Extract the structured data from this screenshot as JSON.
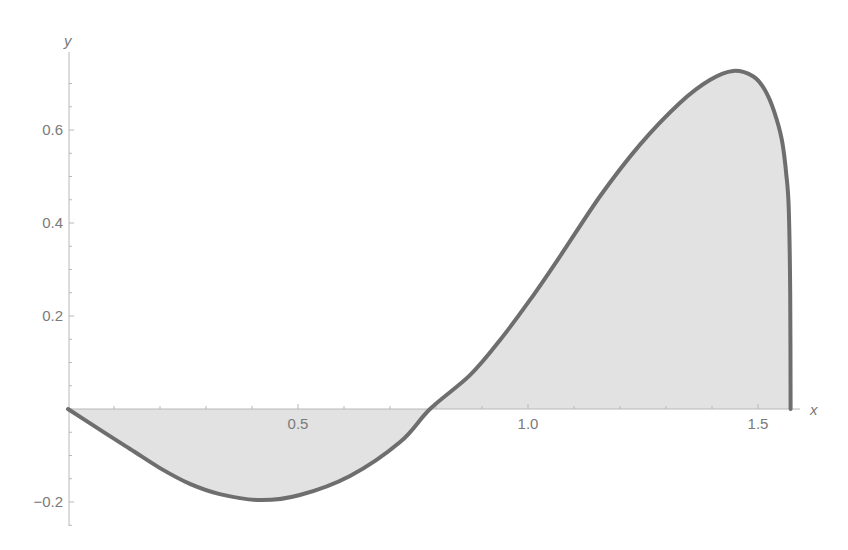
{
  "chart_data": {
    "type": "area",
    "title": "",
    "xlabel": "x",
    "ylabel": "y",
    "xlim": [
      0,
      1.5708
    ],
    "ylim": [
      -0.2,
      0.73
    ],
    "grid": false,
    "legend": null,
    "x_ticks": [
      0.5,
      1.0,
      1.5
    ],
    "x_tick_labels": [
      "0.5",
      "1.0",
      "1.5"
    ],
    "y_ticks": [
      -0.2,
      0.2,
      0.4,
      0.6
    ],
    "y_tick_labels": [
      "−0.2",
      "0.2",
      "0.4",
      "0.6"
    ],
    "fill": "to x-axis",
    "series": [
      {
        "name": "f(x)",
        "x": [
          0,
          0.07,
          0.135,
          0.2,
          0.265,
          0.33,
          0.417,
          0.504,
          0.613,
          0.722,
          0.787,
          0.874,
          0.939,
          1.004,
          1.07,
          1.157,
          1.243,
          1.33,
          1.396,
          1.446,
          1.49,
          1.515,
          1.535,
          1.552,
          1.562,
          1.567,
          1.57,
          1.5708
        ],
        "values": [
          0,
          -0.045,
          -0.086,
          -0.127,
          -0.161,
          -0.183,
          -0.196,
          -0.185,
          -0.144,
          -0.071,
          0,
          0.073,
          0.148,
          0.234,
          0.329,
          0.458,
          0.568,
          0.658,
          0.708,
          0.727,
          0.715,
          0.686,
          0.64,
          0.578,
          0.5,
          0.428,
          0.25,
          0
        ]
      }
    ]
  },
  "colors": {
    "stroke": "#6e6e6e",
    "fill": "#e2e2e2",
    "axis": "#b8b8b8",
    "text": "#7a7a7a"
  }
}
